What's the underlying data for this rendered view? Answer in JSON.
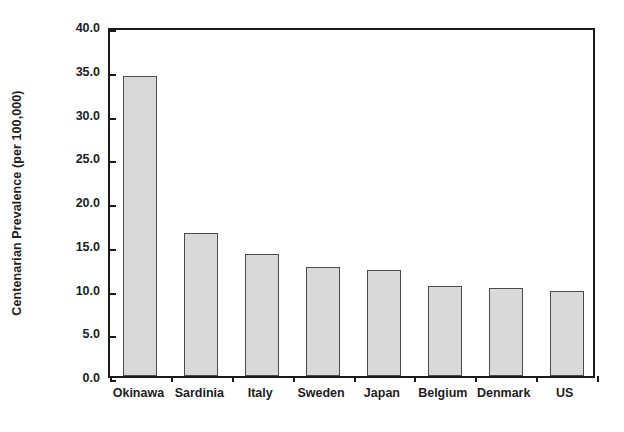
{
  "chart_data": {
    "type": "bar",
    "title": "",
    "xlabel": "",
    "ylabel": "Centenarian Prevalence (per 100,000)",
    "categories": [
      "Okinawa",
      "Sardinia",
      "Italy",
      "Sweden",
      "Japan",
      "Belgium",
      "Denmark",
      "US"
    ],
    "values": [
      34.3,
      16.4,
      13.9,
      12.5,
      12.1,
      10.3,
      10.1,
      9.7
    ],
    "ylim": [
      0.0,
      40.0
    ],
    "ytick_labels": [
      "0.0",
      "5.0",
      "10.0",
      "15.0",
      "20.0",
      "25.0",
      "30.0",
      "35.0",
      "40.0"
    ],
    "ytick_values": [
      0.0,
      5.0,
      10.0,
      15.0,
      20.0,
      25.0,
      30.0,
      35.0,
      40.0
    ],
    "grid": false,
    "legend": null,
    "bar_fill_color": "#d9d9d9",
    "bar_edge_color": "#4a4a4a",
    "axis_color": "#1a1a1a",
    "text_color": "#1d1d1d"
  }
}
